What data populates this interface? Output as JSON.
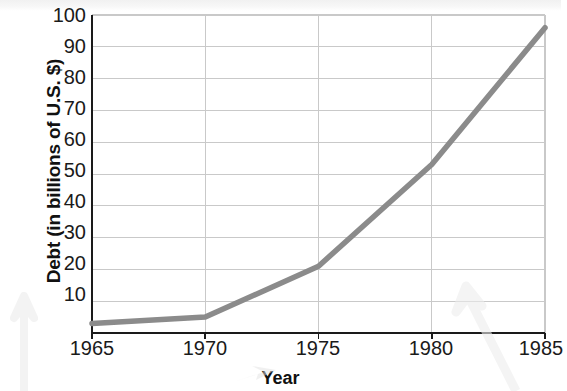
{
  "chart_data": {
    "type": "line",
    "title": "",
    "xlabel": "Year",
    "ylabel": "Debt (in billions of U.S. $)",
    "x": [
      1965,
      1970,
      1975,
      1980,
      1985
    ],
    "values": [
      3,
      5,
      21,
      53,
      96
    ],
    "series": [
      {
        "name": "Debt",
        "values": [
          3,
          5,
          21,
          53,
          96
        ]
      }
    ],
    "xlim": [
      1965,
      1985
    ],
    "ylim": [
      0,
      100
    ],
    "x_tick_labels": [
      "1965",
      "1970",
      "1975",
      "1980",
      "1985"
    ],
    "y_tick_labels": [
      "10",
      "20",
      "30",
      "40",
      "50",
      "60",
      "70",
      "80",
      "90",
      "100"
    ],
    "y_tick_values": [
      10,
      20,
      30,
      40,
      50,
      60,
      70,
      80,
      90,
      100
    ],
    "grid": true,
    "grid_axis": "both",
    "legend": false,
    "legend_position": "none",
    "line_color": "#8b8b8b",
    "grid_color": "#c9c9c9",
    "axis_color": "#1a1a1a",
    "background_color": "#ffffff"
  },
  "artifacts": {
    "arrow_left_label": "scan-arrow-left",
    "arrow_center_label": "scan-arrow-center",
    "arrow_right_label": "scan-arrow-right"
  }
}
